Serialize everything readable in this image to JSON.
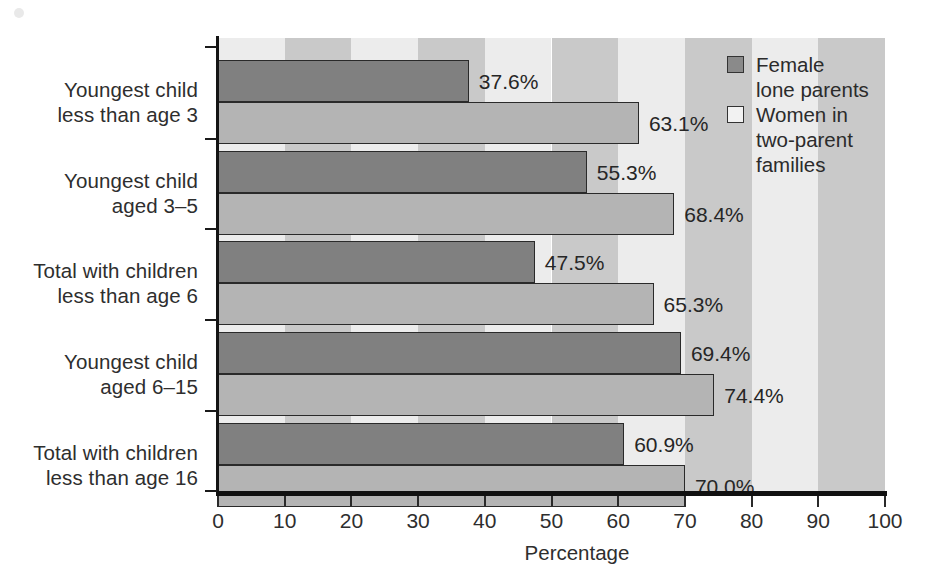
{
  "chart_data": {
    "type": "bar",
    "orientation": "horizontal",
    "title": "",
    "xlabel": "Percentage",
    "ylabel": "",
    "xlim": [
      0,
      100
    ],
    "xticks": [
      "0",
      "10",
      "20",
      "30",
      "40",
      "50",
      "60",
      "70",
      "80",
      "90",
      "100"
    ],
    "grid": false,
    "legend_position": "top-right inside plot",
    "categories": [
      "Youngest child less than age 3",
      "Youngest child aged 3–5",
      "Total with children less than age 6",
      "Youngest child aged 6–15",
      "Total with children less than age 16"
    ],
    "category_lines": [
      [
        "Youngest child",
        "less than age 3"
      ],
      [
        "Youngest child",
        "aged 3–5"
      ],
      [
        "Total with children",
        "less than age 6"
      ],
      [
        "Youngest child",
        "aged 6–15"
      ],
      [
        "Total with children",
        "less than age 16"
      ]
    ],
    "series": [
      {
        "name": "Female lone parents",
        "legend_lines": [
          "Female",
          "lone parents"
        ],
        "color": "#808080",
        "values": [
          37.6,
          55.3,
          47.5,
          69.4,
          60.9
        ],
        "labels": [
          "37.6%",
          "55.3%",
          "47.5%",
          "69.4%",
          "60.9%"
        ]
      },
      {
        "name": "Women in two-parent families",
        "legend_lines": [
          "Women in",
          "two-parent",
          "families"
        ],
        "color": "#b4b4b4",
        "values": [
          63.1,
          68.4,
          65.3,
          74.4,
          70.0
        ],
        "labels": [
          "63.1%",
          "68.4%",
          "65.3%",
          "74.4%",
          "70.0%"
        ]
      }
    ]
  },
  "colors": {
    "series_female_lone_parents": "#808080",
    "series_women_two_parent": "#b4b4b4",
    "band_light": "#ececec",
    "band_dark": "#c9c9c9",
    "axis": "#111111",
    "text": "#2e2e2e"
  }
}
